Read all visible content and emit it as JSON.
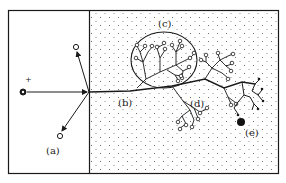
{
  "figure": {
    "labels": {
      "a": "(a)",
      "b": "(b)",
      "c": "(c)",
      "d": "(d)",
      "e": "(e)",
      "charge": "+"
    },
    "colors": {
      "ink": "#1a1a1a",
      "background": "#ffffff",
      "stipple": "#555555"
    },
    "regions": {
      "left_panel": "empty region with source charge and arrows",
      "right_panel": "stippled region with branching tree structure"
    }
  }
}
